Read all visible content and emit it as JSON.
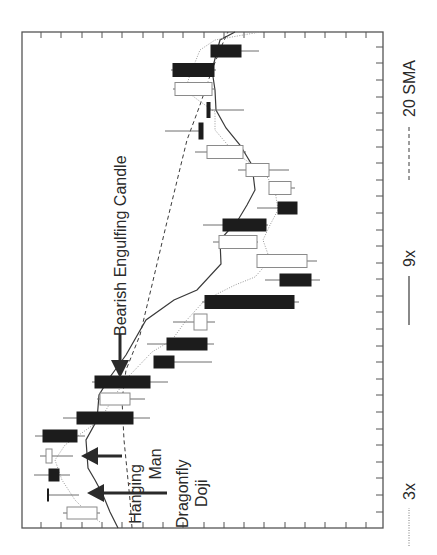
{
  "chart_data": {
    "type": "candlestick",
    "orientation": "rotated 90deg counter-clockwise (time runs bottom-to-top, price increases toward the left)",
    "title": "",
    "xlabel": "",
    "ylabel": "",
    "grid": false,
    "tick_labels": "none shown",
    "legend_position": "right side, rotated",
    "legend": [
      {
        "label": "3x",
        "style": "dotted"
      },
      {
        "label": "9x",
        "style": "solid"
      },
      {
        "label": "20 SMA",
        "style": "dashed"
      }
    ],
    "annotations": [
      {
        "text": "Bearish Engulfing Candle",
        "target_candle_index": 7
      },
      {
        "text": "Hanging Man",
        "target_candle_index": 3
      },
      {
        "text": "Dragonfly Doji",
        "target_candle_index": 1
      }
    ],
    "candles_note": "Values are relative price units (0 = lowest visible price at right edge, 100 = highest at left edge), ordered earliest to latest.",
    "candles": [
      {
        "i": 0,
        "type": "bullish",
        "open": 79,
        "close": 87,
        "high": 89,
        "low": 78
      },
      {
        "i": 1,
        "type": "dragonfly-doji",
        "open": 93,
        "close": 93,
        "high": 93,
        "low": 85
      },
      {
        "i": 2,
        "type": "bearish",
        "open": 93,
        "close": 90,
        "high": 97,
        "low": 86
      },
      {
        "i": 3,
        "type": "hanging-man",
        "open": 92,
        "close": 94,
        "high": 95,
        "low": 86
      },
      {
        "i": 4,
        "type": "bearish",
        "open": 95,
        "close": 85,
        "high": 97,
        "low": 82
      },
      {
        "i": 5,
        "type": "bearish",
        "open": 85,
        "close": 69,
        "high": 89,
        "low": 64
      },
      {
        "i": 6,
        "type": "bullish",
        "open": 70,
        "close": 78,
        "high": 79,
        "low": 66
      },
      {
        "i": 7,
        "type": "bearish-engulfing",
        "open": 80,
        "close": 64,
        "high": 80,
        "low": 59
      },
      {
        "i": 8,
        "type": "bearish",
        "open": 63,
        "close": 58,
        "high": 63,
        "low": 47
      },
      {
        "i": 9,
        "type": "bearish",
        "open": 60,
        "close": 49,
        "high": 65,
        "low": 47
      },
      {
        "i": 10,
        "type": "bullish",
        "open": 49,
        "close": 53,
        "high": 58,
        "low": 47
      },
      {
        "i": 11,
        "type": "bearish",
        "open": 50,
        "close": 25,
        "high": 51,
        "low": 24
      },
      {
        "i": 12,
        "type": "bearish",
        "open": 28,
        "close": 20,
        "high": 32,
        "low": 17
      },
      {
        "i": 13,
        "type": "bullish",
        "open": 21,
        "close": 35,
        "high": 35,
        "low": 18
      },
      {
        "i": 14,
        "type": "bullish",
        "open": 35,
        "close": 46,
        "high": 47,
        "low": 35
      },
      {
        "i": 15,
        "type": "bearish",
        "open": 44,
        "close": 32,
        "high": 50,
        "low": 32
      },
      {
        "i": 16,
        "type": "bearish",
        "open": 29,
        "close": 24,
        "high": 35,
        "low": 24
      },
      {
        "i": 17,
        "type": "bullish",
        "open": 25,
        "close": 31,
        "high": 32,
        "low": 24
      },
      {
        "i": 18,
        "type": "bullish",
        "open": 31,
        "close": 38,
        "high": 40,
        "low": 26
      },
      {
        "i": 19,
        "type": "bullish",
        "open": 39,
        "close": 49,
        "high": 52,
        "low": 38
      },
      {
        "i": 20,
        "type": "bearish",
        "open": 52,
        "close": 51,
        "high": 61,
        "low": 51
      },
      {
        "i": 21,
        "type": "bearish",
        "open": 49,
        "close": 48,
        "high": 49,
        "low": 39
      },
      {
        "i": 22,
        "type": "bullish",
        "open": 47,
        "close": 57,
        "high": 57,
        "low": 47
      },
      {
        "i": 23,
        "type": "bearish",
        "open": 58,
        "close": 47,
        "high": 58,
        "low": 47
      },
      {
        "i": 24,
        "type": "bearish",
        "open": 47,
        "close": 39,
        "high": 48,
        "low": 34
      }
    ],
    "series_note": "Moving averages in relative price units, sampled at candle indices 0..24",
    "series": [
      {
        "name": "3x",
        "style": "dotted",
        "values": [
          79,
          86,
          90,
          91,
          88,
          78,
          74,
          70,
          64,
          59,
          55,
          50,
          41,
          35,
          32,
          33,
          29,
          30,
          34,
          41,
          46,
          46,
          51,
          54,
          50
        ]
      },
      {
        "name": "9x",
        "style": "solid",
        "values": [
          73,
          77,
          81,
          82,
          79,
          78,
          75,
          71,
          66,
          60,
          54,
          47,
          42,
          36,
          36,
          32,
          29,
          29,
          32,
          36,
          42,
          46,
          47,
          48,
          45
        ]
      },
      {
        "name": "20 SMA",
        "style": "dashed",
        "values": [
          70,
          70,
          71,
          72,
          72,
          72,
          73,
          71,
          68,
          65,
          62,
          59,
          56,
          54,
          52,
          50,
          48,
          46,
          44,
          41,
          38,
          34,
          33,
          30,
          28
        ]
      }
    ],
    "axis": {
      "time_ticks": 29,
      "price_ticks": 17,
      "tick_labels_visible": false
    }
  },
  "render": {
    "frame": {
      "x": 22,
      "y": 32,
      "w": 361,
      "h": 496
    },
    "right_ticks_y": [
      47,
      63,
      80,
      97,
      113,
      130,
      147,
      163,
      180,
      196,
      213,
      230,
      246,
      263,
      279,
      296,
      312,
      329,
      346,
      362,
      379,
      395,
      412,
      429,
      445,
      462,
      478,
      495,
      512
    ],
    "top_ticks_x": [
      41,
      61,
      82,
      102,
      122,
      143,
      163,
      183,
      204,
      224,
      244,
      264,
      285,
      305,
      325,
      346,
      366
    ],
    "candles": [
      {
        "y": 513,
        "bx1": 67,
        "bx2": 97,
        "wx1": 63,
        "wx2": 100,
        "h": 12,
        "bear": false
      },
      {
        "y": 495,
        "bx1": 47,
        "bx2": 49,
        "wx1": 48,
        "wx2": 79,
        "h": 13,
        "bear": true,
        "doji": true
      },
      {
        "y": 475,
        "bx1": 49,
        "bx2": 59,
        "wx1": 34,
        "wx2": 70,
        "h": 12,
        "bear": true
      },
      {
        "y": 456,
        "bx1": 46,
        "bx2": 52,
        "wx1": 40,
        "wx2": 73,
        "h": 14,
        "bear": false
      },
      {
        "y": 436,
        "bx1": 43,
        "bx2": 77,
        "wx1": 35,
        "wx2": 85,
        "h": 12,
        "bear": true
      },
      {
        "y": 418,
        "bx1": 77,
        "bx2": 133,
        "wx1": 63,
        "wx2": 150,
        "h": 12,
        "bear": true
      },
      {
        "y": 399,
        "bx1": 100,
        "bx2": 130,
        "wx1": 97,
        "wx2": 145,
        "h": 12,
        "bear": false
      },
      {
        "y": 382,
        "bx1": 95,
        "bx2": 150,
        "wx1": 92,
        "wx2": 168,
        "h": 12,
        "bear": true
      },
      {
        "y": 362,
        "bx1": 154,
        "bx2": 174,
        "wx1": 154,
        "wx2": 212,
        "h": 12,
        "bear": true
      },
      {
        "y": 344,
        "bx1": 167,
        "bx2": 207,
        "wx1": 147,
        "wx2": 214,
        "h": 12,
        "bear": true
      },
      {
        "y": 322,
        "bx1": 194,
        "bx2": 207,
        "wx1": 173,
        "wx2": 215,
        "h": 16,
        "bear": false
      },
      {
        "y": 302,
        "bx1": 205,
        "bx2": 294,
        "wx1": 202,
        "wx2": 299,
        "h": 13,
        "bear": true
      },
      {
        "y": 280,
        "bx1": 280,
        "bx2": 311,
        "wx1": 265,
        "wx2": 320,
        "h": 12,
        "bear": true
      },
      {
        "y": 261,
        "bx1": 257,
        "bx2": 307,
        "wx1": 257,
        "wx2": 317,
        "h": 13,
        "bear": false
      },
      {
        "y": 242,
        "bx1": 219,
        "bx2": 257,
        "wx1": 213,
        "wx2": 258,
        "h": 13,
        "bear": false
      },
      {
        "y": 225,
        "bx1": 223,
        "bx2": 266,
        "wx1": 203,
        "wx2": 268,
        "h": 12,
        "bear": true
      },
      {
        "y": 208,
        "bx1": 278,
        "bx2": 297,
        "wx1": 257,
        "wx2": 297,
        "h": 12,
        "bear": true
      },
      {
        "y": 188,
        "bx1": 269,
        "bx2": 291,
        "wx1": 269,
        "wx2": 295,
        "h": 13,
        "bear": false
      },
      {
        "y": 170,
        "bx1": 246,
        "bx2": 269,
        "wx1": 238,
        "wx2": 289,
        "h": 13,
        "bear": false
      },
      {
        "y": 152,
        "bx1": 207,
        "bx2": 243,
        "wx1": 195,
        "wx2": 246,
        "h": 13,
        "bear": false
      },
      {
        "y": 131,
        "bx1": 199,
        "bx2": 203,
        "wx1": 165,
        "wx2": 203,
        "h": 16,
        "bear": true
      },
      {
        "y": 110,
        "bx1": 207,
        "bx2": 210,
        "wx1": 207,
        "wx2": 244,
        "h": 15,
        "bear": true
      },
      {
        "y": 89,
        "bx1": 175,
        "bx2": 212,
        "wx1": 173,
        "wx2": 215,
        "h": 13,
        "bear": false
      },
      {
        "y": 70,
        "bx1": 173,
        "bx2": 214,
        "wx1": 171,
        "wx2": 216,
        "h": 13,
        "bear": true
      },
      {
        "y": 51,
        "bx1": 211,
        "bx2": 241,
        "wx1": 211,
        "wx2": 259,
        "h": 12,
        "bear": true
      }
    ],
    "lines": {
      "ma9": "118,528 110,512 103,495 95,480 88,468 86,440 97,420 99,395 110,377 126,355 146,320 174,300 197,290 221,264 220,240 238,220 247,205 255,190 252,165 240,145 226,128 216,110 215,90 212,70 220,40 235,32",
      "sma20": "132,528 130,500 127,470 124,440 122,400 126,370 140,335 152,285 165,230 176,185 187,140 200,105 212,70 222,45 228,32",
      "ma3": "100,522 85,510 75,500 62,480 55,460 65,445 100,420 115,395 130,375 152,352 172,340 185,322 205,300 235,285 255,277 270,260 263,240 270,225 278,210 275,190 266,175 232,150 215,130 215,112 198,100 185,90 190,75 200,50 215,40 260,32"
    }
  },
  "labels": {
    "bearish_engulfing": "Bearish Engulfing Candle",
    "hanging_line1": "Hanging",
    "hanging_line2": "Man",
    "doji_line1": "Dragonfly",
    "doji_line2": "Doji",
    "legend_3x": "3x",
    "legend_9x": "9x",
    "legend_20sma": "20 SMA"
  }
}
